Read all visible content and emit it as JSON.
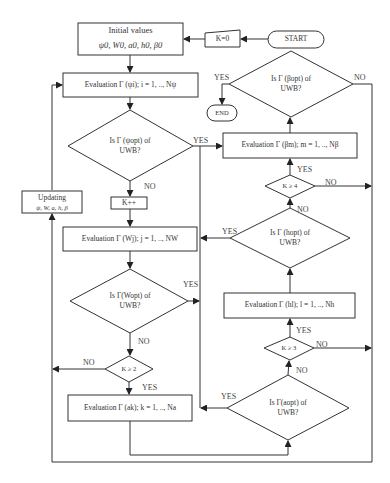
{
  "diagram": {
    "type": "flowchart",
    "nodes": {
      "start": "START",
      "end": "END",
      "k0": "K=0",
      "initial_values_title": "Initial values",
      "initial_values_params": "ψ0, W0, a0, h0, β0",
      "eval_psi": "Evaluation Γ (ψi); i = 1, .., Nψ",
      "psi_decision_line1": "Is Γ (ψopt) of",
      "psi_decision_line2": "UWB?",
      "k_increment": "K++",
      "updating_title": "Updating",
      "updating_params": "ψ, W, a, h, β",
      "eval_w": "Evaluation Γ (Wj); j = 1, .., NW",
      "w_decision_line1": "Is Γ(Wopt) of",
      "w_decision_line2": "UWB?",
      "k_ge_2": "K ≥ 2",
      "eval_a": "Evaluation Γ (ak); k = 1, .., Na",
      "a_decision_line1": "Is Γ(aopt) of",
      "a_decision_line2": "UWB?",
      "k_ge_3": "K ≥ 3",
      "eval_h": "Evaluation Γ (hl); l = 1, .., Nh",
      "h_decision_line1": "Is Γ (hopt) of",
      "h_decision_line2": "UWB?",
      "k_ge_4": "K ≥ 4",
      "eval_beta": "Evaluation Γ (βm); m = 1, .., Nβ",
      "beta_decision_line1": "Is Γ (βopt) of",
      "beta_decision_line2": "UWB?"
    },
    "edge_labels": {
      "yes": "YES",
      "no": "NO"
    },
    "edges": [
      {
        "from": "START",
        "to": "K=0"
      },
      {
        "from": "K=0",
        "to": "Initial values"
      },
      {
        "from": "Initial values",
        "to": "Evaluation Γ(ψi)"
      },
      {
        "from": "Evaluation Γ(ψi)",
        "to": "Is Γ(ψopt) of UWB?"
      },
      {
        "from": "Is Γ(ψopt) of UWB?",
        "to": "Evaluation Γ(βm)",
        "label": "YES"
      },
      {
        "from": "Is Γ(ψopt) of UWB?",
        "to": "K++",
        "label": "NO"
      },
      {
        "from": "K++",
        "to": "Evaluation Γ(Wj)"
      },
      {
        "from": "Evaluation Γ(Wj)",
        "to": "Is Γ(Wopt) of UWB?"
      },
      {
        "from": "Is Γ(Wopt) of UWB?",
        "to": "Evaluation Γ(βm)",
        "label": "YES"
      },
      {
        "from": "Is Γ(Wopt) of UWB?",
        "to": "K ≥ 2",
        "label": "NO"
      },
      {
        "from": "K ≥ 2",
        "to": "Updating",
        "label": "NO"
      },
      {
        "from": "K ≥ 2",
        "to": "Evaluation Γ(ak)",
        "label": "YES"
      },
      {
        "from": "Evaluation Γ(ak)",
        "to": "Is Γ(aopt) of UWB?"
      },
      {
        "from": "Is Γ(aopt) of UWB?",
        "to": "Evaluation Γ(βm)",
        "label": "YES"
      },
      {
        "from": "Is Γ(aopt) of UWB?",
        "to": "K ≥ 3",
        "label": "NO"
      },
      {
        "from": "K ≥ 3",
        "to": "Evaluation Γ(hl)",
        "label": "YES"
      },
      {
        "from": "K ≥ 3",
        "to": "Updating",
        "label": "NO"
      },
      {
        "from": "Evaluation Γ(hl)",
        "to": "Is Γ(hopt) of UWB?"
      },
      {
        "from": "Is Γ(hopt) of UWB?",
        "to": "Evaluation Γ(βm)",
        "label": "YES"
      },
      {
        "from": "Is Γ(hopt) of UWB?",
        "to": "K ≥ 4",
        "label": "NO"
      },
      {
        "from": "K ≥ 4",
        "to": "Evaluation Γ(βm)",
        "label": "YES"
      },
      {
        "from": "K ≥ 4",
        "to": "Updating",
        "label": "NO"
      },
      {
        "from": "Evaluation Γ(βm)",
        "to": "Is Γ(βopt) of UWB?"
      },
      {
        "from": "Is Γ(βopt) of UWB?",
        "to": "END",
        "label": "YES"
      },
      {
        "from": "Is Γ(βopt) of UWB?",
        "to": "Updating",
        "label": "NO"
      },
      {
        "from": "Updating",
        "to": "Evaluation Γ(ψi)"
      }
    ]
  }
}
